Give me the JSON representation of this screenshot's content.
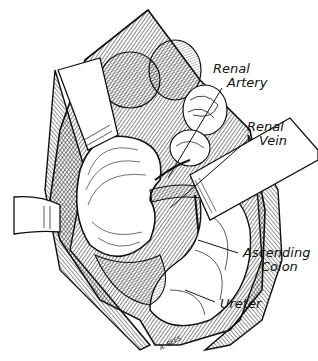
{
  "figure": {
    "colors": {
      "ink": "#111111",
      "paper": "#ffffff"
    },
    "labels": [
      {
        "id": "renal-artery",
        "line1": "Renal",
        "line2": "Artery"
      },
      {
        "id": "renal-vein",
        "line1": "Renal",
        "line2": "Vein"
      },
      {
        "id": "ascending-colon",
        "line1": "Ascending",
        "line2": "Colon"
      },
      {
        "id": "ureter",
        "line1": "Ureter"
      }
    ],
    "signature": "A. REES"
  }
}
